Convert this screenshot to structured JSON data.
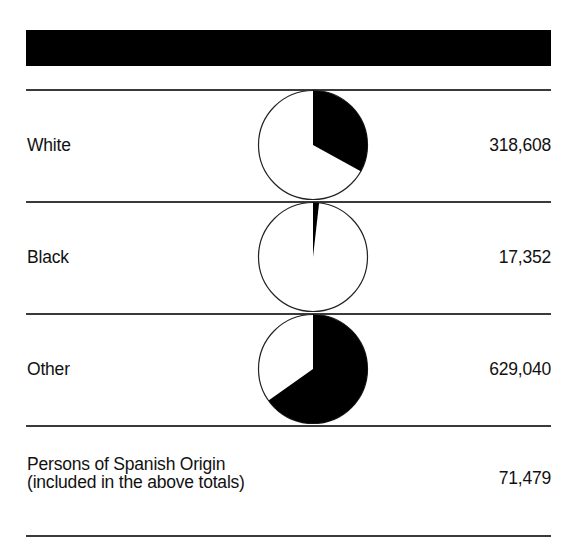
{
  "header": {
    "bar_color": "#000000"
  },
  "rows": [
    {
      "label": "White",
      "value": "318,608",
      "share": 0.33017
    },
    {
      "label": "Black",
      "value": "17,352",
      "share": 0.01798
    },
    {
      "label": "Other",
      "value": "629,040",
      "share": 0.65185
    }
  ],
  "spanish": {
    "label_line1": "Persons of Spanish Origin",
    "label_line2": "(included in the above totals)",
    "value": "71,479"
  },
  "colors": {
    "slice_fill": "#000000",
    "pie_background": "#ffffff",
    "pie_outline": "#222222",
    "rule": "#3a3a3a"
  },
  "chart_data": {
    "type": "pie",
    "title": "",
    "categories": [
      "White",
      "Black",
      "Other"
    ],
    "values": [
      318608,
      17352,
      629040
    ],
    "total": 965000,
    "shares_percent": [
      33.0,
      1.8,
      65.2
    ],
    "additional_row": {
      "label": "Persons of Spanish Origin (included in the above totals)",
      "value": 71479
    },
    "legend": "none",
    "grid": false
  }
}
